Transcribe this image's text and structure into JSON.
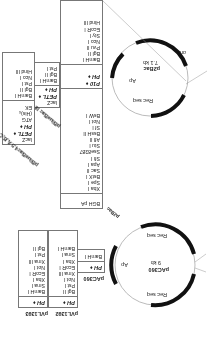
{
  "figure": {
    "orientation": "rotated-180",
    "vectors": {
      "p2bac": {
        "name": "p2Bac",
        "size": "7.1 kb",
        "features": [
          "ori",
          "Ap",
          "Rec seq",
          "Rec seq"
        ],
        "mcs1": [
          "BamH I",
          "Bgl II",
          "Pvu II",
          "Nco I",
          "Sty I",
          "EcoR I",
          "Hind III"
        ],
        "promoters": [
          "PH ♦",
          "P10 ♦"
        ],
        "mcs2": [
          "BsW I",
          "Not I",
          "Sf I",
          "BssH II",
          "Afl II",
          "Stu I",
          "Sse8387",
          "Sfi I",
          "Apa I",
          "Sac II",
          "BstX I",
          "Spe I",
          "Xba I"
        ],
        "terminator": "BGH pA"
      },
      "pbluebac3": {
        "name": "pBlueBac III",
        "promoters": [
          "lacZ",
          "PETL ♦",
          "PH ♦"
        ],
        "mcs": [
          "BamH I",
          "Bgl II",
          "Pst I",
          "Nco I",
          "Hind III"
        ]
      },
      "pbluebac45": {
        "name": "pBlueBac4.5 A,B,C",
        "promoters": [
          "lacZ",
          "PETL ♦",
          "PH ♦"
        ],
        "tags": [
          "ATG",
          "(His)₆",
          "EK"
        ],
        "mcs": [
          "BamH I",
          "Bgl II",
          "Pst I",
          "Nco I",
          "Hind III"
        ]
      },
      "pac360": {
        "name": "pAC360",
        "size": "9 kb",
        "features": [
          "Ap",
          "Rec seq",
          "Rec seq"
        ],
        "promoter": "PH ♦",
        "mcs": [
          "BamH I"
        ]
      },
      "pvl1392": {
        "name": "pVL1392",
        "promoter": "PH ♦",
        "mcs": [
          "Bgl II",
          "Pst I",
          "Not I",
          "Xma III",
          "EcoR I",
          "Xba I",
          "Sma I",
          "BamH I"
        ]
      },
      "pvl1393": {
        "name": "pVL1393",
        "promoter": "PH ♦",
        "mcs": [
          "BamH I",
          "Sma I",
          "Xba I",
          "EcoR I",
          "Not I",
          "Xma III",
          "Pst I",
          "Bgl II"
        ]
      }
    },
    "colors": {
      "line": "#777777",
      "arc": "#111111",
      "thin": "#999999",
      "text": "#222222"
    }
  }
}
